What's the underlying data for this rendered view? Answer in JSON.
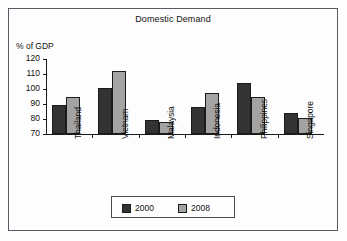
{
  "chart_data": {
    "type": "bar",
    "title": "Domestic Demand",
    "xlabel": "",
    "ylabel": "% of GDP",
    "ylim": [
      70,
      120
    ],
    "ytick_step": 10,
    "yticks": [
      120,
      110,
      100,
      90,
      80,
      70
    ],
    "grid": false,
    "legend_position": "bottom",
    "categories": [
      "Thailand",
      "Vietnam",
      "Malaysia",
      "Indonesia",
      "Philippines",
      "Singapore"
    ],
    "series": [
      {
        "name": "2000",
        "color": "#333333",
        "values": [
          89.5,
          100.5,
          79.5,
          88,
          104,
          84
        ]
      },
      {
        "name": "2008",
        "color": "#a3a3a3",
        "values": [
          94.5,
          112,
          78,
          97.5,
          95,
          80.5
        ]
      }
    ]
  },
  "legend": {
    "entries": [
      {
        "label": "2000"
      },
      {
        "label": "2008"
      }
    ]
  },
  "colors": {
    "series_2000": "#333333",
    "series_2008": "#a3a3a3",
    "frame": "#5a5a66",
    "axis": "#1b1b1b",
    "background": "#fdfdfd"
  }
}
